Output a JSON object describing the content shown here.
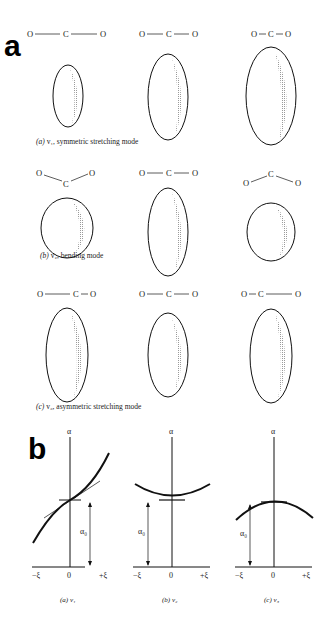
{
  "figure": {
    "panel_a": {
      "label": "a",
      "rows": [
        {
          "caption_prefix": "(a)",
          "caption_text": "v₁, symmetric stretching mode",
          "molecules": [
            "O——C——O",
            "O—C—O",
            "O–C–O"
          ]
        },
        {
          "caption_prefix": "(b)",
          "caption_text": "v₂, bending mode",
          "molecules": [
            "O╲C╱O (bent down)",
            "O—C—O",
            "O╱C╲O (bent up)"
          ]
        },
        {
          "caption_prefix": "(c)",
          "caption_text": "v₃, asymmetric stretching mode",
          "molecules": [
            "O——C–O",
            "O—C—O",
            "O–C——O"
          ]
        }
      ],
      "atoms": {
        "oxygen": "O",
        "carbon": "C"
      }
    },
    "panel_b": {
      "label": "b",
      "y_axis_label": "α",
      "alpha0_label": "α₀",
      "x_ticks": [
        "−ξ",
        "0",
        "+ξ"
      ],
      "plots": [
        {
          "caption_prefix": "(a)",
          "caption_mode": "v₁",
          "shape": "linear-increasing-through-alpha0"
        },
        {
          "caption_prefix": "(b)",
          "caption_mode": "v₂",
          "shape": "parabola-minimum-at-alpha0"
        },
        {
          "caption_prefix": "(c)",
          "caption_mode": "v₃",
          "shape": "parabola-maximum-at-alpha0"
        }
      ]
    }
  }
}
